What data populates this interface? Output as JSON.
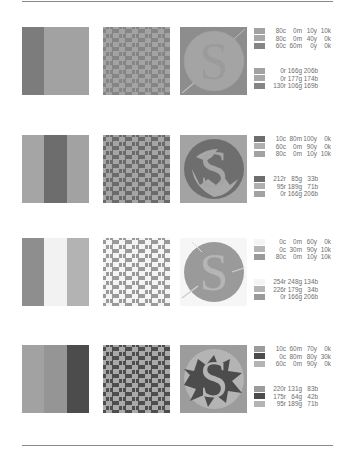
{
  "rows": [
    {
      "stripes": [
        "#7c7c7c",
        "#a2a2a2",
        "#a2a2a2"
      ],
      "checker": {
        "base": "#a3a3a3",
        "accent": "#858585"
      },
      "logo": {
        "bg": "#8d8d8d",
        "circle": "#a4a4a4",
        "letter": "#a4a4a4",
        "splash": "#a4a4a4"
      },
      "cmyk": [
        {
          "swatch": "#a2a2a2",
          "c": "80c",
          "m": "0m",
          "y": "10y",
          "k": "10k"
        },
        {
          "swatch": "#a8a8a8",
          "c": "80c",
          "m": "0m",
          "y": "40y",
          "k": "0k"
        },
        {
          "swatch": "#858585",
          "c": "60c",
          "m": "60m",
          "y": "0y",
          "k": "0k"
        }
      ],
      "rgb": [
        {
          "swatch": "#a2a2a2",
          "r": "0r",
          "g": "166g",
          "b": "206b"
        },
        {
          "swatch": "#a8a8a8",
          "r": "0r",
          "g": "177g",
          "b": "174b"
        },
        {
          "swatch": "#858585",
          "r": "130r",
          "g": "106g",
          "b": "169b"
        }
      ]
    },
    {
      "stripes": [
        "#a5a5a5",
        "#6d6d6d",
        "#a2a2a2"
      ],
      "checker": {
        "base": "#a5a5a5",
        "accent": "#6b6b6b"
      },
      "logo": {
        "bg": "#a3a3a3",
        "circle": "#6e6e6e",
        "letter": "#6e6e6e",
        "splash": "#a8a8a8"
      },
      "cmyk": [
        {
          "swatch": "#6d6d6d",
          "c": "10c",
          "m": "80m",
          "y": "100y",
          "k": "0k"
        },
        {
          "swatch": "#b0b0b0",
          "c": "60c",
          "m": "0m",
          "y": "90y",
          "k": "0k"
        },
        {
          "swatch": "#a2a2a2",
          "c": "80c",
          "m": "0m",
          "y": "10y",
          "k": "10k"
        }
      ],
      "rgb": [
        {
          "swatch": "#6d6d6d",
          "r": "212r",
          "g": "85g",
          "b": "33b"
        },
        {
          "swatch": "#b0b0b0",
          "r": "95r",
          "g": "189g",
          "b": "71b"
        },
        {
          "swatch": "#a2a2a2",
          "r": "0r",
          "g": "166g",
          "b": "206b"
        }
      ]
    },
    {
      "stripes": [
        "#8e8e8e",
        "#f2f2f2",
        "#b3b3b3"
      ],
      "checker": {
        "base": "#f4f4f4",
        "accent": "#9a9a9a"
      },
      "logo": {
        "bg": "#f6f6f6",
        "circle": "#9a9a9a",
        "letter": "#b5b5b5",
        "splash": "#b5b5b5"
      },
      "cmyk": [
        {
          "swatch": "#f4f4f4",
          "c": "0c",
          "m": "0m",
          "y": "60y",
          "k": "0k"
        },
        {
          "swatch": "#b5b5b5",
          "c": "0c",
          "m": "30m",
          "y": "90y",
          "k": "10k"
        },
        {
          "swatch": "#9a9a9a",
          "c": "80c",
          "m": "0m",
          "y": "10y",
          "k": "10k"
        }
      ],
      "rgb": [
        {
          "swatch": "#f4f4f4",
          "r": "254r",
          "g": "248g",
          "b": "134b"
        },
        {
          "swatch": "#b5b5b5",
          "r": "226r",
          "g": "179g",
          "b": "34b"
        },
        {
          "swatch": "#9a9a9a",
          "r": "0r",
          "g": "166g",
          "b": "206b"
        }
      ]
    },
    {
      "stripes": [
        "#a2a2a2",
        "#959595",
        "#4c4c4c"
      ],
      "checker": {
        "base": "#a9a9a9",
        "accent": "#4e4e4e"
      },
      "logo": {
        "bg": "#9c9c9c",
        "circle": "#b4b4b4",
        "letter": "#b4b4b4",
        "splash": "#4c4c4c"
      },
      "cmyk": [
        {
          "swatch": "#9c9c9c",
          "c": "10c",
          "m": "60m",
          "y": "70y",
          "k": "0k"
        },
        {
          "swatch": "#4c4c4c",
          "c": "0c",
          "m": "80m",
          "y": "80y",
          "k": "30k"
        },
        {
          "swatch": "#b4b4b4",
          "c": "60c",
          "m": "0m",
          "y": "90y",
          "k": "0k"
        }
      ],
      "rgb": [
        {
          "swatch": "#9c9c9c",
          "r": "220r",
          "g": "131g",
          "b": "83b"
        },
        {
          "swatch": "#4c4c4c",
          "r": "175r",
          "g": "64g",
          "b": "42b"
        },
        {
          "swatch": "#b4b4b4",
          "r": "95r",
          "g": "189g",
          "b": "71b"
        }
      ]
    }
  ]
}
